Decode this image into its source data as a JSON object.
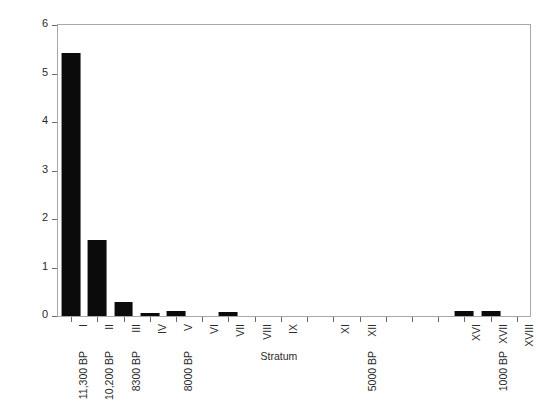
{
  "chart_data": {
    "type": "bar",
    "title": "",
    "xlabel": "Stratum",
    "ylabel": "Percent of Specimens per Stratum",
    "ylim": [
      0,
      6
    ],
    "yticks": [
      0,
      1,
      2,
      3,
      4,
      5,
      6
    ],
    "ytick_labels": [
      "0",
      "1",
      "2",
      "3",
      "4",
      "5",
      "6"
    ],
    "grid": false,
    "legend": null,
    "bar_color": "#0b0b0b",
    "frame_color": "#a8a8a8",
    "categories": [
      "I",
      "II",
      "III",
      "IV",
      "V",
      "VI",
      "VII",
      "VIII",
      "IX",
      "X",
      "XI",
      "XII",
      "XIII",
      "XIV",
      "XV",
      "XVI",
      "XVII",
      "XVIII"
    ],
    "tick_labels": [
      "I",
      "II",
      "III",
      "IV",
      "V",
      "VI",
      "VII",
      "VIII",
      "IX",
      "",
      "XI",
      "XII",
      "",
      "",
      "",
      "XVI",
      "XVII",
      "XVIII"
    ],
    "values": [
      5.43,
      1.57,
      0.28,
      0.06,
      0.11,
      0.0,
      0.08,
      0.0,
      0.0,
      0.0,
      0.0,
      0.0,
      0.0,
      0.0,
      0.0,
      0.1,
      0.11,
      0.0
    ],
    "secondary_tick_labels": [
      "11,300 BP",
      "10,200 BP",
      "8300 BP",
      "",
      "8000 BP",
      "",
      "",
      "",
      "",
      "",
      "",
      "5000 BP",
      "",
      "",
      "",
      "",
      "1000 BP",
      ""
    ],
    "annotations": []
  }
}
